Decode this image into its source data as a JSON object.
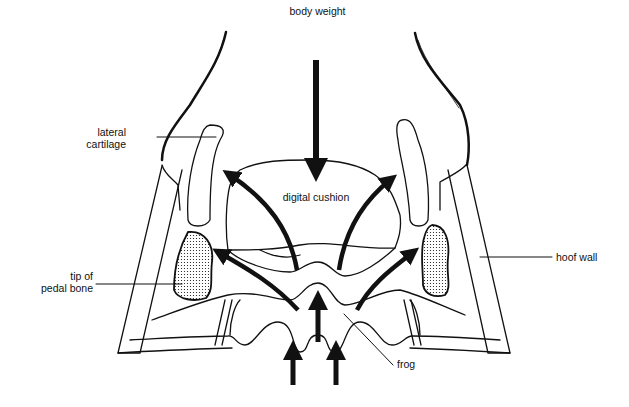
{
  "diagram": {
    "labels": {
      "body_weight": "body weight",
      "lateral_cartilage_1": "lateral",
      "lateral_cartilage_2": "cartilage",
      "digital_cushion": "digital cushion",
      "tip_pedal_bone_1": "tip of",
      "tip_pedal_bone_2": "pedal bone",
      "hoof_wall": "hoof wall",
      "frog": "frog"
    },
    "colors": {
      "line": "#111111",
      "background": "#ffffff"
    }
  }
}
